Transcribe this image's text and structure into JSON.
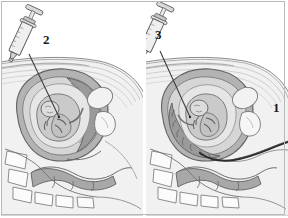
{
  "figure": {
    "style": "grayscale line-and-wash medical illustration",
    "border_color": "#b9b9b9",
    "background": "#ffffff",
    "panel_count": 2
  },
  "labels": [
    {
      "id": "label-1",
      "text": "1",
      "panel": "right",
      "refers_to": "transcervical-catheter",
      "x": 275,
      "y": 108
    },
    {
      "id": "label-2",
      "text": "2",
      "panel": "left",
      "refers_to": "transabdominal-needle-syringe",
      "x": 45,
      "y": 40
    },
    {
      "id": "label-3",
      "text": "3",
      "panel": "right",
      "refers_to": "transabdominal-needle-syringe",
      "x": 157,
      "y": 35
    }
  ],
  "panels": {
    "left": {
      "name": "left-panel",
      "instrument": "syringe-with-needle",
      "instrument_label": "2",
      "approach": "transabdominal",
      "structures": [
        "abdominal-wall",
        "uterus",
        "amniotic-cavity",
        "placenta",
        "fetus",
        "umbilical-cord",
        "bladder",
        "pubic-bone",
        "sacrum-vertebrae",
        "rectum",
        "bowel"
      ]
    },
    "right": {
      "name": "right-panel",
      "instrument": "syringe-with-needle",
      "instrument_label": "3",
      "secondary_instrument": "transcervical-catheter",
      "secondary_instrument_label": "1",
      "approach": "transabdominal and transcervical",
      "structures": [
        "abdominal-wall",
        "uterus",
        "amniotic-cavity",
        "placenta",
        "fetus",
        "umbilical-cord",
        "bladder",
        "pubic-bone",
        "sacrum-vertebrae",
        "rectum",
        "bowel",
        "cervix",
        "vagina"
      ]
    }
  },
  "colors": {
    "outline": "#6b6b6b",
    "outline_dark": "#3d3d3d",
    "skin_light": "#f3f3f3",
    "tissue_light": "#e4e4e4",
    "tissue_mid": "#cfcfcf",
    "tissue_dark": "#ababab",
    "uterus_wall": "#9c9c9c",
    "amnion": "#dedede",
    "fetus": "#bdbdbd",
    "placenta": "#8f8f8f",
    "bone": "#f7f7f7",
    "catheter": "#2b2b2b",
    "needle": "#4a4a4a",
    "syringe_barrel": "#ededed",
    "label_text": "#1a1a1a"
  }
}
